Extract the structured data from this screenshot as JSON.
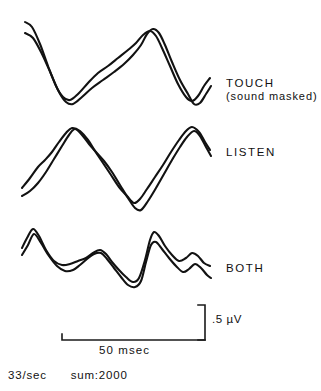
{
  "figure": {
    "background_color": "#ffffff",
    "trace_color": "#121212",
    "width": 321,
    "height": 391
  },
  "conditions": [
    {
      "label": "TOUCH",
      "sublabel": "(sound masked)"
    },
    {
      "label": "LISTEN",
      "sublabel": ""
    },
    {
      "label": "BOTH",
      "sublabel": ""
    }
  ],
  "scales": {
    "amplitude_label": ".5 µV",
    "time_label": "50 msec"
  },
  "footer": {
    "rate": "33/sec",
    "sum": "sum:2000"
  },
  "chart_data": {
    "type": "line",
    "title": "",
    "xlabel": "50 msec",
    "ylabel": ".5 µV",
    "grid": false,
    "legend_position": "right",
    "annotations": [
      "TOUCH",
      "(sound masked)",
      "LISTEN",
      "BOTH",
      ".5 µV",
      "50 msec",
      "33/sec",
      "sum:2000"
    ],
    "axis_scale": {
      "time_bar_x": [
        62,
        205
      ],
      "time_bar_value": "50 msec",
      "amp_bar_y": [
        305,
        340
      ],
      "amp_bar_value": ".5 µV"
    },
    "series": [
      {
        "name": "TOUCH trace 1",
        "condition": "TOUCH",
        "points": [
          [
            25,
            22
          ],
          [
            32,
            27
          ],
          [
            40,
            44
          ],
          [
            48,
            66
          ],
          [
            56,
            86
          ],
          [
            63,
            97
          ],
          [
            70,
            100
          ],
          [
            78,
            94
          ],
          [
            88,
            83
          ],
          [
            98,
            73
          ],
          [
            108,
            66
          ],
          [
            118,
            58
          ],
          [
            128,
            50
          ],
          [
            136,
            43
          ],
          [
            143,
            35
          ],
          [
            150,
            31
          ],
          [
            156,
            36
          ],
          [
            162,
            48
          ],
          [
            170,
            66
          ],
          [
            178,
            84
          ],
          [
            186,
            97
          ],
          [
            192,
            101
          ],
          [
            198,
            96
          ],
          [
            204,
            86
          ],
          [
            210,
            78
          ]
        ]
      },
      {
        "name": "TOUCH trace 2",
        "condition": "TOUCH",
        "points": [
          [
            25,
            33
          ],
          [
            33,
            38
          ],
          [
            42,
            54
          ],
          [
            51,
            74
          ],
          [
            59,
            92
          ],
          [
            66,
            102
          ],
          [
            73,
            104
          ],
          [
            82,
            97
          ],
          [
            92,
            88
          ],
          [
            103,
            80
          ],
          [
            114,
            72
          ],
          [
            124,
            64
          ],
          [
            133,
            55
          ],
          [
            141,
            45
          ],
          [
            147,
            34
          ],
          [
            153,
            29
          ],
          [
            159,
            33
          ],
          [
            165,
            45
          ],
          [
            172,
            62
          ],
          [
            180,
            80
          ],
          [
            188,
            94
          ],
          [
            194,
            104
          ],
          [
            200,
            103
          ],
          [
            206,
            94
          ],
          [
            211,
            86
          ]
        ]
      },
      {
        "name": "LISTEN trace 1",
        "condition": "LISTEN",
        "points": [
          [
            22,
            188
          ],
          [
            30,
            178
          ],
          [
            38,
            167
          ],
          [
            45,
            160
          ],
          [
            52,
            152
          ],
          [
            59,
            142
          ],
          [
            66,
            133
          ],
          [
            72,
            128
          ],
          [
            80,
            131
          ],
          [
            88,
            140
          ],
          [
            95,
            151
          ],
          [
            103,
            163
          ],
          [
            111,
            175
          ],
          [
            119,
            187
          ],
          [
            127,
            196
          ],
          [
            134,
            203
          ],
          [
            140,
            199
          ],
          [
            147,
            189
          ],
          [
            155,
            177
          ],
          [
            163,
            165
          ],
          [
            171,
            152
          ],
          [
            179,
            140
          ],
          [
            186,
            131
          ],
          [
            192,
            127
          ],
          [
            199,
            132
          ],
          [
            205,
            142
          ],
          [
            210,
            150
          ]
        ]
      },
      {
        "name": "LISTEN trace 2",
        "condition": "LISTEN",
        "points": [
          [
            22,
            196
          ],
          [
            30,
            191
          ],
          [
            38,
            183
          ],
          [
            46,
            172
          ],
          [
            54,
            159
          ],
          [
            62,
            146
          ],
          [
            69,
            135
          ],
          [
            75,
            129
          ],
          [
            82,
            135
          ],
          [
            89,
            144
          ],
          [
            96,
            152
          ],
          [
            104,
            161
          ],
          [
            112,
            172
          ],
          [
            120,
            185
          ],
          [
            128,
            198
          ],
          [
            135,
            208
          ],
          [
            141,
            210
          ],
          [
            148,
            201
          ],
          [
            156,
            188
          ],
          [
            164,
            174
          ],
          [
            172,
            160
          ],
          [
            180,
            147
          ],
          [
            187,
            137
          ],
          [
            194,
            131
          ],
          [
            200,
            136
          ],
          [
            206,
            147
          ],
          [
            211,
            156
          ]
        ]
      },
      {
        "name": "BOTH trace 1",
        "condition": "BOTH",
        "points": [
          [
            22,
            248
          ],
          [
            27,
            238
          ],
          [
            33,
            229
          ],
          [
            39,
            236
          ],
          [
            46,
            250
          ],
          [
            54,
            261
          ],
          [
            62,
            265
          ],
          [
            70,
            264
          ],
          [
            78,
            261
          ],
          [
            86,
            258
          ],
          [
            93,
            253
          ],
          [
            100,
            250
          ],
          [
            106,
            254
          ],
          [
            112,
            262
          ],
          [
            119,
            270
          ],
          [
            126,
            277
          ],
          [
            133,
            282
          ],
          [
            139,
            278
          ],
          [
            145,
            260
          ],
          [
            150,
            240
          ],
          [
            154,
            232
          ],
          [
            159,
            236
          ],
          [
            165,
            246
          ],
          [
            172,
            255
          ],
          [
            179,
            261
          ],
          [
            186,
            258
          ],
          [
            192,
            253
          ],
          [
            198,
            256
          ],
          [
            204,
            263
          ],
          [
            210,
            266
          ]
        ]
      },
      {
        "name": "BOTH trace 2",
        "condition": "BOTH",
        "points": [
          [
            22,
            255
          ],
          [
            28,
            245
          ],
          [
            34,
            234
          ],
          [
            41,
            243
          ],
          [
            49,
            256
          ],
          [
            57,
            266
          ],
          [
            65,
            271
          ],
          [
            73,
            270
          ],
          [
            80,
            265
          ],
          [
            87,
            259
          ],
          [
            94,
            254
          ],
          [
            101,
            253
          ],
          [
            107,
            259
          ],
          [
            114,
            268
          ],
          [
            121,
            277
          ],
          [
            128,
            285
          ],
          [
            135,
            287
          ],
          [
            141,
            281
          ],
          [
            146,
            262
          ],
          [
            151,
            245
          ],
          [
            156,
            242
          ],
          [
            162,
            249
          ],
          [
            169,
            258
          ],
          [
            176,
            266
          ],
          [
            183,
            272
          ],
          [
            189,
            269
          ],
          [
            195,
            264
          ],
          [
            201,
            268
          ],
          [
            207,
            275
          ],
          [
            211,
            278
          ]
        ]
      }
    ]
  }
}
